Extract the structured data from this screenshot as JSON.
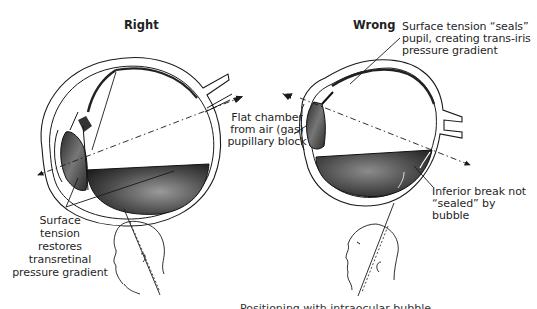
{
  "diagram": {
    "panels": [
      {
        "title": "Right",
        "description": "Eye with gas bubble, patient head tilted face-down",
        "labels": {
          "surface_tension": [
            "Surface",
            "tension",
            "restores",
            "transretinal",
            "pressure gradient"
          ]
        }
      },
      {
        "title": "Wrong",
        "description": "Eye with gas bubble, patient head tilted face-up",
        "labels": {
          "seals_pupil": [
            "Surface tension “seals”",
            "pupil, creating trans-iris",
            "pressure gradient"
          ],
          "inferior_break": [
            "Inferior break not",
            "“sealed” by",
            "bubble"
          ]
        }
      }
    ],
    "shared_labels": {
      "flat_chamber": [
        "Flat chamber",
        "from air (gas)",
        "pupillary block"
      ]
    },
    "caption": "Positioning with intraocular bubble",
    "colors": {
      "ink": "#1a1a1a",
      "fluid_dark": "#3a3a3a",
      "fluid_mid": "#7a7a7a",
      "background": "#ffffff"
    }
  }
}
